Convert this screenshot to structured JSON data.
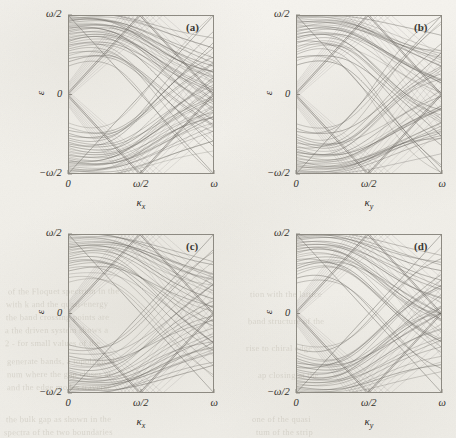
{
  "figure": {
    "type": "multi-panel-band-structure",
    "panel_count": 4,
    "rows": 2,
    "cols": 2,
    "background_color": "#f1efe9",
    "line_color": "#6b6862",
    "frame_color": "#8d8a82"
  },
  "bleed_through": [
    {
      "text": "of the  Floquet  spectrum  in  the",
      "x": 8,
      "y": 286,
      "size": 8.5,
      "rot": -0.4
    },
    {
      "text": "with  k  and  the  quasi-energy",
      "x": 6,
      "y": 299,
      "size": 8.5,
      "rot": -0.3
    },
    {
      "text": "the  band  crossing  points  are",
      "x": 6,
      "y": 312,
      "size": 8.5,
      "rot": -0.2
    },
    {
      "text": "a  the  driven  system  shows  a",
      "x": 5,
      "y": 325,
      "size": 8.5,
      "rot": -0.3
    },
    {
      "text": "2  -  for  small  values  of  the",
      "x": 5,
      "y": 338,
      "size": 8.5,
      "rot": -0.2
    },
    {
      "text": "generate   bands,   a   topological",
      "x": 7,
      "y": 356,
      "size": 8.5,
      "rot": -0.2
    },
    {
      "text": "num  where  the  gap  closes  at",
      "x": 7,
      "y": 369,
      "size": 8.5,
      "rot": -0.3
    },
    {
      "text": "and  the  edge  modes  traverse",
      "x": 7,
      "y": 382,
      "size": 8.5,
      "rot": -0.2
    },
    {
      "text": "the  bulk  gap  as  shown  in  the",
      "x": 6,
      "y": 414,
      "size": 8.5,
      "rot": -0.2
    },
    {
      "text": "spectra  of  the  two  boundaries",
      "x": 4,
      "y": 427,
      "size": 8.5,
      "rot": -0.2
    },
    {
      "text": "tion  with  the  lattice",
      "x": 250,
      "y": 289,
      "size": 8.5,
      "rot": -0.2
    },
    {
      "text": "band  structure  of  the",
      "x": 248,
      "y": 316,
      "size": 8.5,
      "rot": -0.2
    },
    {
      "text": "rise  to  chiral  edge",
      "x": 246,
      "y": 343,
      "size": 8.5,
      "rot": -0.2
    },
    {
      "text": "ap  closing  at  the",
      "x": 258,
      "y": 370,
      "size": 8.5,
      "rot": -0.2
    },
    {
      "text": "one  of  the  quasi",
      "x": 252,
      "y": 414,
      "size": 8.5,
      "rot": -0.2
    },
    {
      "text": "tum  of  the  strip",
      "x": 256,
      "y": 427,
      "size": 8.5,
      "rot": -0.2
    }
  ],
  "panels": [
    {
      "id": "a",
      "label": "(a)",
      "xlabel": "κ",
      "xlabel_sub": "x",
      "ylabel": "ε",
      "xticks": [
        "0",
        "ω/2",
        "ω"
      ],
      "yticks": [
        "ω/2",
        "0",
        "−ω/2"
      ],
      "frame": {
        "left": 68,
        "top": 15,
        "width": 146,
        "height": 159
      },
      "chart_data": {
        "type": "line",
        "title": "(a)",
        "xlabel": "κ_x",
        "ylabel": "ε",
        "xlim": [
          0,
          1
        ],
        "ylim": [
          -0.5,
          0.5
        ],
        "xtick_values": [
          0,
          0.5,
          1
        ],
        "xtick_labels": [
          "0",
          "ω/2",
          "ω"
        ],
        "ytick_values": [
          -0.5,
          0,
          0.5
        ],
        "ytick_labels": [
          "−ω/2",
          "0",
          "ω/2"
        ],
        "grid": false,
        "legend": false,
        "n_bands": 30,
        "band_family": "cosine-folded",
        "bulk_bandwidth": 0.46,
        "gap_at_k0": 0.3,
        "edge_modes": 4,
        "edge_mode_slope": 1.0,
        "edge_crossing_k": 0.5,
        "band_phase_spread": 0.95,
        "series_note": "Dense manifold of bulk bands symmetric about ε=0 plus linear edge branches emanating from (0,0) and folding at κ=ω/2."
      }
    },
    {
      "id": "b",
      "label": "(b)",
      "xlabel": "κ",
      "xlabel_sub": "y",
      "ylabel": "ε",
      "xticks": [
        "0",
        "ω/2",
        "ω"
      ],
      "yticks": [
        "ω/2",
        "0",
        "−ω/2"
      ],
      "frame": {
        "left": 296,
        "top": 15,
        "width": 146,
        "height": 159
      },
      "chart_data": {
        "type": "line",
        "title": "(b)",
        "xlabel": "κ_y",
        "ylabel": "ε",
        "xlim": [
          0,
          1
        ],
        "ylim": [
          -0.5,
          0.5
        ],
        "xtick_values": [
          0,
          0.5,
          1
        ],
        "xtick_labels": [
          "0",
          "ω/2",
          "ω"
        ],
        "ytick_values": [
          -0.5,
          0,
          0.5
        ],
        "ytick_labels": [
          "−ω/2",
          "0",
          "ω/2"
        ],
        "grid": false,
        "legend": false,
        "n_bands": 28,
        "band_family": "cosine-folded",
        "bulk_bandwidth": 0.45,
        "gap_at_k0": 0.31,
        "edge_modes": 4,
        "edge_mode_slope": 1.0,
        "edge_crossing_k": 0.5,
        "band_phase_spread": 0.92,
        "series_note": "Same band manifold plotted along κ_y; slightly sparser than panel (a)."
      }
    },
    {
      "id": "c",
      "label": "(c)",
      "xlabel": "κ",
      "xlabel_sub": "x",
      "ylabel": "ε",
      "xticks": [
        "0",
        "ω/2",
        "ω"
      ],
      "yticks": [
        "ω/2",
        "0",
        "−ω/2"
      ],
      "frame": {
        "left": 68,
        "top": 234,
        "width": 146,
        "height": 159
      },
      "chart_data": {
        "type": "line",
        "title": "(c)",
        "xlabel": "κ_x",
        "ylabel": "ε",
        "xlim": [
          0,
          1
        ],
        "ylim": [
          -0.5,
          0.5
        ],
        "xtick_values": [
          0,
          0.5,
          1
        ],
        "xtick_labels": [
          "0",
          "ω/2",
          "ω"
        ],
        "ytick_values": [
          -0.5,
          0,
          0.5
        ],
        "ytick_labels": [
          "−ω/2",
          "0",
          "ω/2"
        ],
        "grid": false,
        "legend": false,
        "n_bands": 24,
        "band_family": "cosine-folded",
        "bulk_bandwidth": 0.44,
        "gap_at_k0": 0.33,
        "edge_modes": 4,
        "edge_mode_slope": 1.0,
        "edge_crossing_k": 0.5,
        "band_phase_spread": 0.88,
        "series_note": "Fewer, more separated bulk bands; edge branches unchanged."
      }
    },
    {
      "id": "d",
      "label": "(d)",
      "xlabel": "κ",
      "xlabel_sub": "y",
      "ylabel": "ε",
      "xticks": [
        "0",
        "ω/2",
        "ω"
      ],
      "yticks": [
        "ω/2",
        "0",
        "−ω/2"
      ],
      "frame": {
        "left": 296,
        "top": 234,
        "width": 146,
        "height": 159
      },
      "chart_data": {
        "type": "line",
        "title": "(d)",
        "xlabel": "κ_y",
        "ylabel": "ε",
        "xlim": [
          0,
          1
        ],
        "ylim": [
          -0.5,
          0.5
        ],
        "xtick_values": [
          0,
          0.5,
          1
        ],
        "xtick_labels": [
          "0",
          "ω/2",
          "ω"
        ],
        "ytick_values": [
          -0.5,
          0,
          0.5
        ],
        "ytick_labels": [
          "−ω/2",
          "0",
          "ω/2"
        ],
        "grid": false,
        "legend": false,
        "n_bands": 24,
        "band_family": "cosine-folded",
        "bulk_bandwidth": 0.45,
        "gap_at_k0": 0.32,
        "edge_modes": 4,
        "edge_mode_slope": 1.0,
        "edge_crossing_k": 0.5,
        "band_phase_spread": 0.9,
        "series_note": "Counterpart of (c) along κ_y."
      }
    }
  ]
}
